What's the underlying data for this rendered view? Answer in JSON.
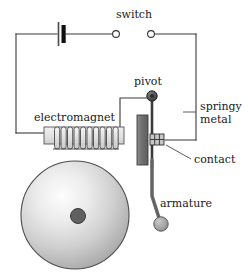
{
  "diagram": {
    "labels": {
      "switch": "switch",
      "pivot": "pivot",
      "springy_metal_line1": "springy",
      "springy_metal_line2": "metal",
      "electromagnet": "electromagnet",
      "contact": "contact",
      "armature": "armature"
    },
    "colors": {
      "wire": "#3a3a3a",
      "outline": "#1a1a1a",
      "background": "#ffffff",
      "text": "#1a1a1a",
      "core_fill": "#e2e2e2",
      "coil_fill": "#d8d8d8",
      "plate_fill": "#777777",
      "pivot_fill": "#555555",
      "hammer_fill": "#9a9a9a",
      "gong_edge": "#8f8f8f",
      "gong_highlight": "#f2f2f2",
      "gong_center": "#5a5a5a",
      "contact_fill": "#bdbdbd",
      "battery_thick": "#111111",
      "battery_thin": "#444444"
    },
    "components": {
      "battery": {
        "name": "battery-cell",
        "terminals": 2
      },
      "switch": {
        "name": "open-switch",
        "state": "open",
        "contacts": 2
      },
      "electromagnet": {
        "name": "electromagnet-coil",
        "turns": 11
      },
      "springy_metal": {
        "name": "springy-metal-strip"
      },
      "pivot": {
        "name": "pivot-point"
      },
      "contact": {
        "name": "electrical-contact"
      },
      "armature": {
        "name": "armature-arm-with-hammer"
      },
      "gong": {
        "name": "bell-gong"
      }
    }
  }
}
